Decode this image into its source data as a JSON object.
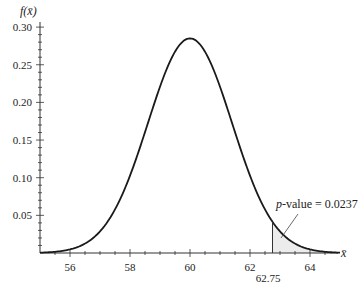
{
  "chart_data": {
    "type": "line",
    "title": "",
    "xlabel": "x̄",
    "ylabel": "f(x̄)",
    "distribution": {
      "name": "normal",
      "mean": 60,
      "sd": 1.4
    },
    "xlim": [
      55,
      65
    ],
    "ylim": [
      0,
      0.3
    ],
    "x_ticks": [
      56,
      58,
      60,
      62,
      64
    ],
    "y_ticks": [
      0.05,
      0.1,
      0.15,
      0.2,
      0.25,
      0.3
    ],
    "y_tick_labels": [
      "0.05",
      "0.10",
      "0.15",
      "0.20",
      "0.25",
      "0.30"
    ],
    "x_tick_labels": [
      "56",
      "58",
      "60",
      "62",
      "64"
    ],
    "grid": false,
    "shaded_region": {
      "from": 62.75,
      "to": 65,
      "color": "#ececec"
    },
    "annotations": [
      {
        "text": "62.75",
        "x": 62.75,
        "position": "below-axis"
      },
      {
        "prefix": "p",
        "text": "-value = 0.0237",
        "target_x": 63.1
      }
    ]
  }
}
